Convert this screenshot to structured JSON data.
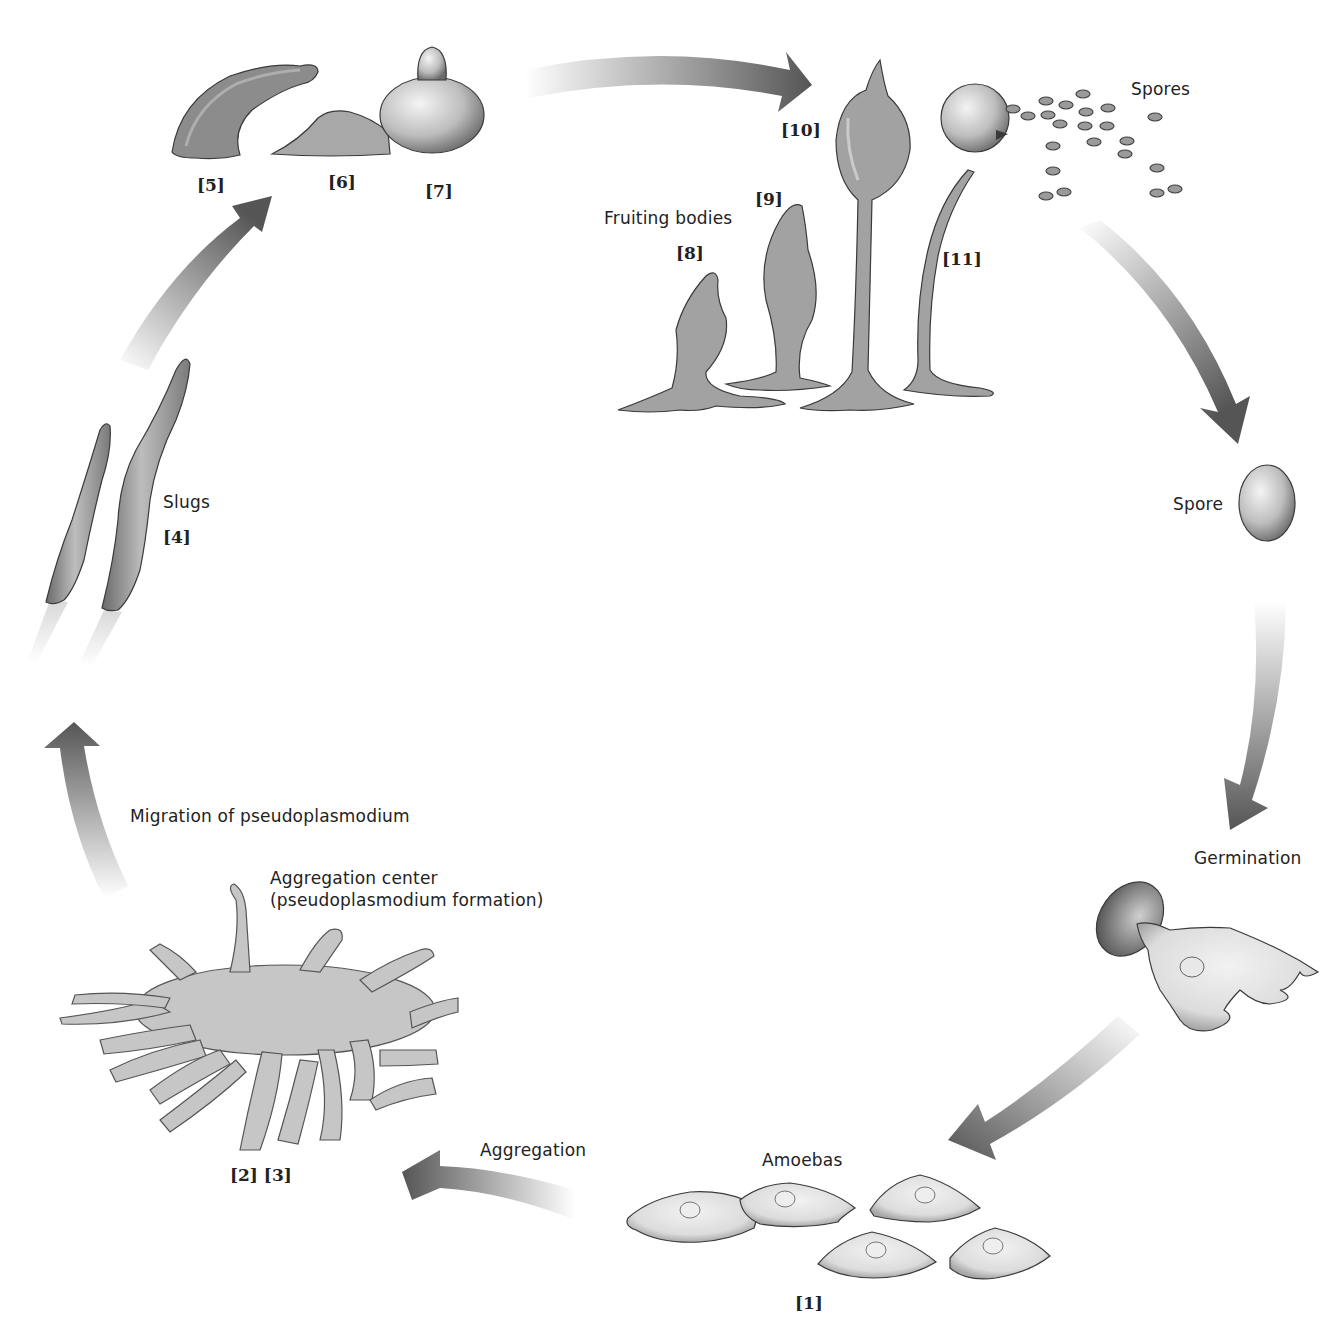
{
  "diagram": {
    "type": "life-cycle",
    "colors": {
      "arrow_dark": "#555555",
      "arrow_light": "#ffffff",
      "organism_fill": "#9a9a9a",
      "organism_stroke": "#3a3a3a",
      "amoeba_fill": "#e2e2e2",
      "text": "#222222"
    },
    "labels": {
      "spores": "Spores",
      "spore": "Spore",
      "germination": "Germination",
      "amoebas": "Amoebas",
      "aggregation": "Aggregation",
      "aggregation_center_line1": "Aggregation center",
      "aggregation_center_line2": "(pseudoplasmodium formation)",
      "migration": "Migration of pseudoplasmodium",
      "slugs": "Slugs",
      "fruiting_bodies": "Fruiting bodies"
    },
    "stage_numbers": {
      "s1": "[1]",
      "s2_3": "[2] [3]",
      "s4": "[4]",
      "s5": "[5]",
      "s6": "[6]",
      "s7": "[7]",
      "s8": "[8]",
      "s9": "[9]",
      "s10": "[10]",
      "s11": "[11]"
    },
    "stages": [
      {
        "id": 1,
        "name": "Amoebas"
      },
      {
        "id": 2,
        "name": "Aggregation"
      },
      {
        "id": 3,
        "name": "Aggregation center (pseudoplasmodium formation)"
      },
      {
        "id": 4,
        "name": "Slugs"
      },
      {
        "id": 5,
        "name": "Culmination start"
      },
      {
        "id": 6,
        "name": "Culmination"
      },
      {
        "id": 7,
        "name": "Culmination"
      },
      {
        "id": 8,
        "name": "Fruiting bodies"
      },
      {
        "id": 9,
        "name": "Fruiting bodies"
      },
      {
        "id": 10,
        "name": "Fruiting bodies"
      },
      {
        "id": 11,
        "name": "Mature sporangium releasing spores"
      }
    ],
    "flow": [
      "Amoebas",
      "Aggregation",
      "Aggregation center",
      "Migration of pseudoplasmodium",
      "Slugs",
      "[5]-[7]",
      "Fruiting bodies",
      "Spores",
      "Spore",
      "Germination",
      "Amoebas"
    ]
  }
}
